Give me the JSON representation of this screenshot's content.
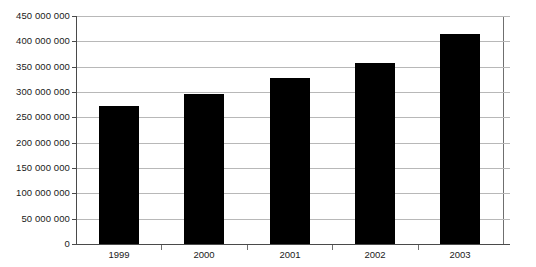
{
  "chart_data": {
    "type": "bar",
    "title": "",
    "subtitle": "",
    "xlabel": "",
    "ylabel": "",
    "categories": [
      "1999",
      "2000",
      "2001",
      "2002",
      "2003"
    ],
    "values": [
      273000000,
      296000000,
      328000000,
      357000000,
      415000000
    ],
    "series": [
      {
        "name": "",
        "values": [
          273000000,
          296000000,
          328000000,
          357000000,
          415000000
        ]
      }
    ],
    "ylim": [
      0,
      450000000
    ],
    "ytick_values": [
      0,
      50000000,
      100000000,
      150000000,
      200000000,
      250000000,
      300000000,
      350000000,
      400000000,
      450000000
    ],
    "ytick_labels": [
      "0",
      "50 000 000",
      "100 000 000",
      "150 000 000",
      "200 000 000",
      "250 000 000",
      "300 000 000",
      "350 000 000",
      "400 000 000",
      "450 000 000"
    ],
    "grid": true,
    "legend": false,
    "legend_position": "none",
    "bar_color": "#000000",
    "gridline_color": "#b8b8b8",
    "axis_color": "#4a4a4a",
    "background_color": "#ffffff",
    "annotations": []
  }
}
